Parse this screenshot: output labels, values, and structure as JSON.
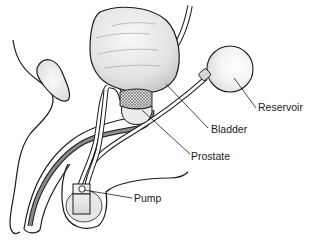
{
  "diagram": {
    "labels": [
      {
        "id": "reservoir",
        "text": "Reservoir",
        "x": 258,
        "y": 108
      },
      {
        "id": "bladder",
        "text": "Bladder",
        "x": 211,
        "y": 129
      },
      {
        "id": "prostate",
        "text": "Prostate",
        "x": 191,
        "y": 156
      },
      {
        "id": "pump",
        "text": "Pump",
        "x": 134,
        "y": 198
      }
    ],
    "colors": {
      "outline": "#1a1a1a",
      "organ_fill": "#e8e8e8",
      "organ_highlight": "#f7f7f7",
      "urethra_fill": "#8a8a8a",
      "tube_fill": "#ffffff",
      "background": "#ffffff"
    }
  }
}
